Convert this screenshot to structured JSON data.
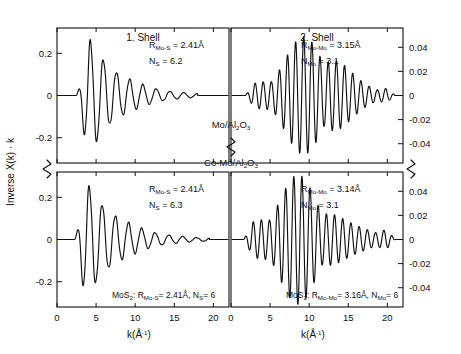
{
  "figure": {
    "y_axis_label_left": "Inverse X(k) · k",
    "x_axis_label": "k(Å-1)",
    "x_axis_label_base": "k(Å",
    "x_axis_label_exp": "-1",
    "x_axis_label_close": ")",
    "center_labels": {
      "top": "Mo/Al2O3",
      "top_parts": [
        "Mo/Al",
        "2",
        "O",
        "3"
      ],
      "bottom": "Co-Mo/Al2O3",
      "bottom_parts": [
        "Co-Mo/Al",
        "2",
        "O",
        "3"
      ]
    }
  },
  "chart_data": {
    "type": "line",
    "xlabel": "k(Å-1)",
    "ylabel": "Inverse X(k)·k",
    "grid": false,
    "legend": "none",
    "panels": [
      {
        "id": "top-left",
        "column_title": "1. Shell",
        "row_sample": "Mo/Al2O3",
        "xlim": [
          0,
          22
        ],
        "xticks": [
          0,
          5,
          10,
          15,
          20
        ],
        "ylim": [
          -0.32,
          0.32
        ],
        "yticks": [
          0.2,
          0,
          -0.2
        ],
        "ytick_labels": [
          "0.2",
          "0",
          "-0.2"
        ],
        "y_axis_side": "left",
        "annotations": [
          {
            "label_base": "R",
            "label_sub": "Mo-S",
            "eq": "= 2.41Å"
          },
          {
            "label_base": "N",
            "label_sub": "S",
            "eq": "= 6.2"
          }
        ],
        "wave": {
          "k_start": 2.4,
          "k_end": 18.0,
          "period_k": 1.62,
          "phase": 0.55,
          "amp_peak": 0.285,
          "amp_peak_k": 4.1,
          "rise_width": 1.1,
          "decay": 0.255,
          "tail_amp": 0.012,
          "description": "strongly damped single-frequency oscillation, max amplitude near k=4, decaying to near zero by k=16"
        }
      },
      {
        "id": "top-right",
        "column_title": "2. Shell",
        "row_sample": "Mo/Al2O3",
        "xlim": [
          0,
          22
        ],
        "xticks": [
          0,
          5,
          10,
          15,
          20
        ],
        "ylim": [
          -0.056,
          0.056
        ],
        "yticks": [
          0.04,
          0.02,
          0,
          -0.02,
          -0.04
        ],
        "ytick_labels": [
          "0.04",
          "0.02",
          "0",
          "-0.02",
          "-0.04"
        ],
        "y_axis_side": "right",
        "annotations": [
          {
            "label_base": "R",
            "label_sub": "Mo-Mo",
            "eq": "= 3.15Å"
          },
          {
            "label_base": "N",
            "label_sub": "Mo",
            "eq": "= 3.1"
          }
        ],
        "wave": {
          "k_start": 1.8,
          "k_end": 21.0,
          "period_k": 1.03,
          "phase": 0.0,
          "amp_peak": 0.052,
          "amp_peak_k": 10.2,
          "env_width": 4.6,
          "base_amp": 0.007,
          "description": "beat-type envelope, high frequency, maximum amplitude near k=10, small tails at both ends"
        }
      },
      {
        "id": "bottom-left",
        "column_title": "1. Shell",
        "row_sample": "Co-Mo/Al2O3",
        "xlim": [
          0,
          22
        ],
        "xticks": [
          0,
          5,
          10,
          15,
          20
        ],
        "ylim": [
          -0.32,
          0.32
        ],
        "yticks": [
          0.2,
          0,
          -0.2
        ],
        "ytick_labels": [
          "0.2",
          "0",
          "-0.2"
        ],
        "y_axis_side": "left",
        "annotations": [
          {
            "label_base": "R",
            "label_sub": "Mo-S",
            "eq": "= 2.41Å"
          },
          {
            "label_base": "N",
            "label_sub": "S",
            "eq": "= 6.3"
          }
        ],
        "footnote": {
          "prefix": "MoS",
          "prefix_sub": "2",
          "text": ": R",
          "text_sub": "Mo-S",
          "text2": "= 2.41Å, N",
          "text2_sub": "S",
          "text3": "= 6"
        },
        "wave": {
          "k_start": 2.2,
          "k_end": 19.5,
          "period_k": 1.62,
          "phase": 0.35,
          "amp_peak": 0.3,
          "amp_peak_k": 3.6,
          "rise_width": 1.0,
          "decay": 0.245,
          "tail_amp": 0.013,
          "description": "strongly damped single-frequency oscillation, max amplitude near k=3.6, small ripple tail out to k=19"
        }
      },
      {
        "id": "bottom-right",
        "column_title": "2. Shell",
        "row_sample": "Co-Mo/Al2O3",
        "xlim": [
          0,
          22
        ],
        "xticks": [
          0,
          5,
          10,
          15,
          20
        ],
        "ylim": [
          -0.056,
          0.056
        ],
        "yticks": [
          0.04,
          0.02,
          0,
          -0.02,
          -0.04
        ],
        "ytick_labels": [
          "0.04",
          "0.02",
          "0",
          "-0.02",
          "-0.04"
        ],
        "y_axis_side": "right",
        "annotations": [
          {
            "label_base": "R",
            "label_sub": "Mo-Mo",
            "eq": "= 3.14Å"
          },
          {
            "label_base": "N",
            "label_sub": "Mo",
            "eq": "= 3.1"
          }
        ],
        "footnote": {
          "prefix": "MoS",
          "prefix_sub": "2",
          "text": ": R",
          "text_sub": "Mo-Mo",
          "text2": "= 3.16Å, N",
          "text2_sub": "Mo",
          "text3": "= 6"
        },
        "wave": {
          "k_start": 1.6,
          "k_end": 21.0,
          "period_k": 1.03,
          "phase": 0.2,
          "amp_peak": 0.054,
          "amp_peak_k": 8.8,
          "env_width": 4.2,
          "base_amp": 0.01,
          "description": "beat-type envelope, high frequency, maximum amplitude near k=9, secondary ripple lobe around k=15-19"
        }
      }
    ]
  }
}
